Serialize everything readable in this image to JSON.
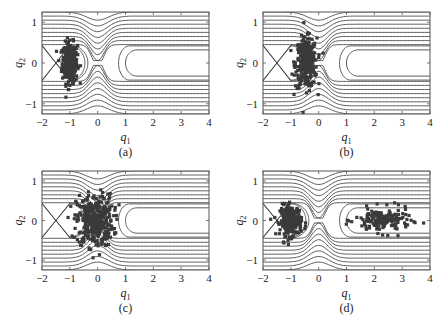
{
  "figure": {
    "panels": [
      {
        "id": "a",
        "caption": "(a)",
        "frame": {
          "x": 42,
          "y": 12,
          "w": 167,
          "h": 102
        }
      },
      {
        "id": "b",
        "caption": "(b)",
        "frame": {
          "x": 263,
          "y": 12,
          "w": 167,
          "h": 102
        }
      },
      {
        "id": "c",
        "caption": "(c)",
        "frame": {
          "x": 42,
          "y": 171,
          "w": 167,
          "h": 99
        }
      },
      {
        "id": "d",
        "caption": "(d)",
        "frame": {
          "x": 263,
          "y": 171,
          "w": 167,
          "h": 99
        }
      }
    ],
    "colors": {
      "contour": "#333333",
      "dots": "#3a3a3a",
      "frame": "#555555",
      "text": "#222222"
    }
  },
  "chart_data": [
    {
      "type": "scatter",
      "title": "(a)",
      "xlabel": "q1",
      "ylabel": "q2",
      "xlim": [
        -2,
        4
      ],
      "ylim": [
        -1.25,
        1.25
      ],
      "xticks": [
        -2,
        -1,
        0,
        1,
        2,
        3,
        4
      ],
      "yticks": [
        -1,
        0,
        1
      ],
      "grid": false,
      "overlay": "contour lines of potential, saddle at q1=0, wells at q1=-1 and open channel q1>1",
      "cloud": {
        "center": [
          -1.0,
          0.0
        ],
        "spread": [
          0.25,
          0.45
        ],
        "n": 300,
        "shape": "tight ellipse"
      }
    },
    {
      "type": "scatter",
      "title": "(b)",
      "xlabel": "q1",
      "ylabel": "q2",
      "xlim": [
        -2,
        4
      ],
      "ylim": [
        -1.25,
        1.25
      ],
      "xticks": [
        -2,
        -1,
        0,
        1,
        2,
        3,
        4
      ],
      "yticks": [
        -1,
        0,
        1
      ],
      "grid": false,
      "cloud": {
        "center": [
          -0.45,
          0.0
        ],
        "spread": [
          0.35,
          0.55
        ],
        "n": 300,
        "shape": "spreading toward saddle"
      }
    },
    {
      "type": "scatter",
      "title": "(c)",
      "xlabel": "q1",
      "ylabel": "q2",
      "xlim": [
        -2,
        4
      ],
      "ylim": [
        -1.25,
        1.25
      ],
      "xticks": [
        -2,
        -1,
        0,
        1,
        2,
        3,
        4
      ],
      "yticks": [
        -1,
        0,
        1
      ],
      "grid": false,
      "cloud": {
        "center": [
          -0.1,
          0.0
        ],
        "spread": [
          0.6,
          0.6
        ],
        "n": 380,
        "shape": "spread across saddle up to q1≈1.6"
      }
    },
    {
      "type": "scatter",
      "title": "(d)",
      "xlabel": "q1",
      "ylabel": "q2",
      "xlim": [
        -2,
        4
      ],
      "ylim": [
        -1.25,
        1.25
      ],
      "xticks": [
        -2,
        -1,
        0,
        1,
        2,
        3,
        4
      ],
      "yticks": [
        -1,
        0,
        1
      ],
      "grid": false,
      "cloud": {
        "clusters": [
          {
            "center": [
              -1.0,
              0.0
            ],
            "spread": [
              0.35,
              0.35
            ],
            "n": 230
          },
          {
            "center": [
              2.3,
              0.0
            ],
            "spread": [
              0.9,
              0.28
            ],
            "n": 160
          }
        ],
        "shape": "split: left well cluster + transmitted band q1 in [0.8, 4]"
      }
    }
  ]
}
